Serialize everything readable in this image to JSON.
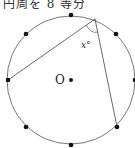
{
  "caption": "円周を 8 等分",
  "diagram": {
    "center_label": "O",
    "angle_label": "x°",
    "divisions": 8,
    "colors": {
      "stroke": "#444444",
      "point": "#111111"
    }
  }
}
